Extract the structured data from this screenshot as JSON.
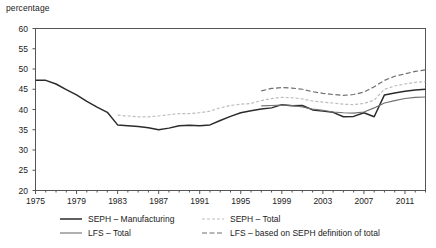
{
  "chart_data": {
    "type": "line",
    "title": "",
    "ylabel": "percentage",
    "xlabel": "",
    "ylim": [
      20,
      60
    ],
    "xlim": [
      1975,
      2013
    ],
    "grid": false,
    "legend_position": "bottom",
    "ytick_labels": [
      "20",
      "25",
      "30",
      "35",
      "40",
      "45",
      "50",
      "55",
      "60"
    ],
    "ytick_values": [
      20,
      25,
      30,
      35,
      40,
      45,
      50,
      55,
      60
    ],
    "xtick_labels": [
      "1975",
      "1979",
      "1983",
      "1987",
      "1991",
      "1995",
      "1999",
      "2003",
      "2007",
      "2011"
    ],
    "xtick_values": [
      1975,
      1979,
      1983,
      1987,
      1991,
      1995,
      1999,
      2003,
      2007,
      2011
    ],
    "xtick_minor_values": [
      1976,
      1977,
      1978,
      1980,
      1981,
      1982,
      1984,
      1985,
      1986,
      1988,
      1989,
      1990,
      1992,
      1993,
      1994,
      1996,
      1997,
      1998,
      2000,
      2001,
      2002,
      2004,
      2005,
      2006,
      2008,
      2009,
      2010,
      2012,
      2013
    ],
    "series": [
      {
        "name": "SEPH – Manufacturing",
        "style": "solid",
        "color": "#2b2b2b",
        "width": 1.5,
        "x": [
          1975,
          1976,
          1977,
          1978,
          1979,
          1980,
          1981,
          1982,
          1983,
          1984,
          1985,
          1986,
          1987,
          1988,
          1989,
          1990,
          1991,
          1992,
          1993,
          1994,
          1995,
          1996,
          1997,
          1998,
          1999,
          2000,
          2001,
          2002,
          2003,
          2004,
          2005,
          2006,
          2007,
          2008,
          2009,
          2010,
          2011,
          2012,
          2013
        ],
        "values": [
          47.2,
          47.2,
          46.3,
          44.9,
          43.6,
          42.0,
          40.6,
          39.3,
          36.2,
          36.0,
          35.8,
          35.5,
          35.0,
          35.4,
          36.0,
          36.1,
          36.0,
          36.2,
          37.3,
          38.3,
          39.2,
          39.7,
          40.1,
          40.4,
          41.2,
          40.9,
          41.0,
          39.9,
          39.6,
          39.3,
          38.2,
          38.3,
          39.2,
          38.2,
          43.6,
          44.1,
          44.5,
          44.8,
          45.0
        ]
      },
      {
        "name": "LFS – Total",
        "style": "solid",
        "color": "#707070",
        "width": 1.1,
        "x": [
          1997,
          1998,
          1999,
          2000,
          2001,
          2002,
          2003,
          2004,
          2005,
          2006,
          2007,
          2008,
          2009,
          2010,
          2011,
          2012,
          2013
        ],
        "values": [
          40.9,
          41.0,
          41.1,
          41.0,
          40.6,
          40.1,
          39.8,
          39.4,
          39.2,
          39.1,
          39.4,
          40.4,
          41.6,
          42.2,
          42.7,
          43.0,
          43.1
        ]
      },
      {
        "name": "SEPH – Total",
        "style": "dotted",
        "color": "#bdbdbd",
        "width": 1.2,
        "x": [
          1983,
          1984,
          1985,
          1986,
          1987,
          1988,
          1989,
          1990,
          1991,
          1992,
          1993,
          1994,
          1995,
          1996,
          1997,
          1998,
          1999,
          2000,
          2001,
          2002,
          2003,
          2004,
          2005,
          2006,
          2007,
          2008,
          2009,
          2010,
          2011,
          2012,
          2013
        ],
        "values": [
          38.6,
          38.4,
          38.2,
          38.2,
          38.4,
          38.7,
          39.0,
          39.0,
          39.2,
          39.6,
          40.4,
          41.0,
          41.3,
          41.5,
          42.2,
          42.7,
          43.0,
          42.9,
          42.6,
          42.1,
          41.8,
          41.6,
          41.3,
          41.2,
          41.5,
          42.3,
          45.0,
          45.8,
          46.3,
          46.7,
          46.9
        ]
      },
      {
        "name": "LFS – based on SEPH definition of total",
        "style": "dashed",
        "color": "#6e6e6e",
        "width": 1.2,
        "x": [
          1997,
          1998,
          1999,
          2000,
          2001,
          2002,
          2003,
          2004,
          2005,
          2006,
          2007,
          2008,
          2009,
          2010,
          2011,
          2012,
          2013
        ],
        "values": [
          44.6,
          45.2,
          45.4,
          45.3,
          45.0,
          44.4,
          44.0,
          43.7,
          43.5,
          43.7,
          44.3,
          45.6,
          47.2,
          48.2,
          48.8,
          49.4,
          49.8
        ]
      }
    ]
  },
  "legend": {
    "left": [
      {
        "label": "SEPH – Manufacturing",
        "swatch": "solid-dark-line-icon"
      },
      {
        "label": "LFS – Total",
        "swatch": "solid-gray-line-icon"
      }
    ],
    "right": [
      {
        "label": "SEPH – Total",
        "swatch": "dotted-light-line-icon"
      },
      {
        "label": "LFS – based on SEPH definition of total",
        "swatch": "dashed-gray-line-icon"
      }
    ]
  }
}
